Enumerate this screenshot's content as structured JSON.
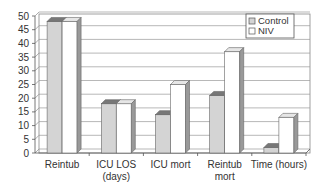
{
  "chart_data": {
    "type": "bar",
    "title": "",
    "xlabel": "",
    "ylabel": "",
    "ylim": [
      0,
      50
    ],
    "yticks": [
      0,
      5,
      10,
      15,
      20,
      25,
      30,
      35,
      40,
      45,
      50
    ],
    "grid": true,
    "legend_position": "top-right",
    "categories": [
      "Reintub",
      "ICU LOS (days)",
      "ICU mort",
      "Reintub mort",
      "Time (hours)"
    ],
    "category_lines": [
      [
        "Reintub"
      ],
      [
        "ICU LOS",
        "(days)"
      ],
      [
        "ICU mort"
      ],
      [
        "Reintub",
        "mort"
      ],
      [
        "Time (hours)"
      ]
    ],
    "series": [
      {
        "name": "Control",
        "color": "#d4d4d4",
        "values": [
          48,
          18,
          14,
          21,
          2
        ]
      },
      {
        "name": "NIV",
        "color": "#ffffff",
        "values": [
          48,
          18,
          25,
          37,
          13
        ]
      }
    ]
  }
}
